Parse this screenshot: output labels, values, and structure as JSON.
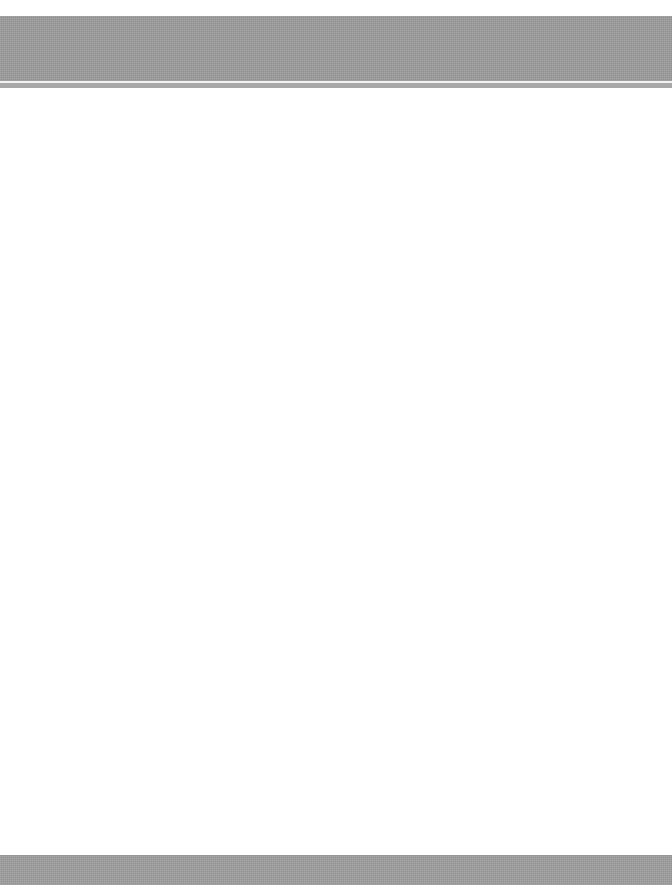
{
  "page": {
    "background_color": "#ffffff",
    "header_band": {
      "color": "#9c9c9c",
      "rule_color": "#f2f2f2"
    },
    "footer_band": {
      "color": "#9e9e9e"
    },
    "body": {
      "text": ""
    }
  }
}
